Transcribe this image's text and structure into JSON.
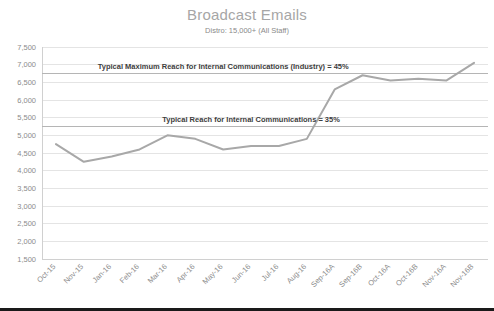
{
  "chart_data": {
    "type": "line",
    "title": "Broadcast Emails",
    "subtitle": "Distro: 15,000+ (All Staff)",
    "xlabel": "",
    "ylabel": "",
    "ylim": [
      1500,
      7500
    ],
    "ytick_step": 500,
    "ytick_labels": [
      "7,500",
      "7,000",
      "6,500",
      "6,000",
      "5,500",
      "5,000",
      "4,500",
      "4,000",
      "3,500",
      "3,000",
      "2,500",
      "2,000",
      "1,500"
    ],
    "ytick_values": [
      7500,
      7000,
      6500,
      6000,
      5500,
      5000,
      4500,
      4000,
      3500,
      3000,
      2500,
      2000,
      1500
    ],
    "grid": true,
    "legend": "none",
    "categories": [
      "Oct-15",
      "Nov-15",
      "Jan-16",
      "Feb-16",
      "Mar-16",
      "Apr-16",
      "May-16",
      "Jun-16",
      "Jul-16",
      "Aug-16",
      "Sep-16A",
      "Sep-16B",
      "Oct-16A",
      "Oct-16B",
      "Nov-16A",
      "Nov-16B"
    ],
    "series": [
      {
        "name": "Broadcast Emails Reach",
        "color": "#a8a8a8",
        "values": [
          4750,
          4250,
          4400,
          4600,
          5000,
          4900,
          4600,
          4700,
          4700,
          4900,
          6300,
          6700,
          6550,
          6600,
          6550,
          7050
        ]
      }
    ],
    "reference_lines": [
      {
        "label": "Typical Maximum Reach for Internal Communications (Industry) = 45%",
        "value": 6750,
        "color": "#b5b5b5",
        "label_x_category_index": 6
      },
      {
        "label": "Typical Reach for  Internal Communications = 35%",
        "value": 5250,
        "color": "#b5b5b5",
        "label_x_category_index": 7
      }
    ]
  },
  "colors": {
    "title": "#a6a6a6",
    "subtitle": "#8a8a8a",
    "tick": "#8c8c8c",
    "grid": "#e4e4e4",
    "series": "#a8a8a8",
    "annotation": "#3d3d3d",
    "background": "#ffffff",
    "bottom_border": "#1a1a1a"
  }
}
